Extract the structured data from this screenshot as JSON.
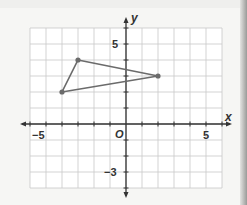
{
  "chart_data": {
    "type": "scatter",
    "subtype": "coordinate-plane-polygon",
    "title": "",
    "xlabel": "x",
    "ylabel": "y",
    "origin_label": "O",
    "xlim": [
      -6,
      6
    ],
    "ylim": [
      -4,
      6
    ],
    "grid": true,
    "x_tick_labels": [
      {
        "value": -5,
        "label": "−5"
      },
      {
        "value": 5,
        "label": "5"
      }
    ],
    "y_tick_labels": [
      {
        "value": 5,
        "label": "5"
      },
      {
        "value": -3,
        "label": "−3"
      }
    ],
    "series": [
      {
        "name": "triangle",
        "closed": true,
        "points": [
          {
            "x": -3,
            "y": 4
          },
          {
            "x": 2,
            "y": 3
          },
          {
            "x": -4,
            "y": 2
          }
        ],
        "color": "#6b6b6b"
      }
    ]
  },
  "colors": {
    "grid": "#c8c8c8",
    "axis": "#333333",
    "polygon": "#6b6b6b",
    "background": "#ffffff"
  }
}
